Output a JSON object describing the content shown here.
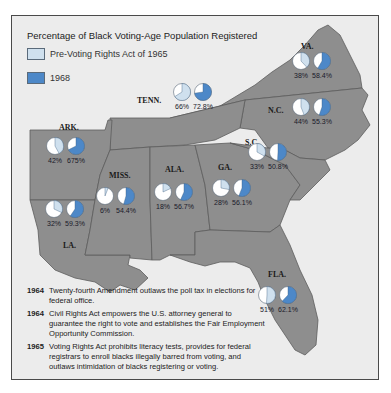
{
  "title": "Percentage of Black Voting-Age Population Registered",
  "legend": [
    {
      "label": "Pre-Voting Rights Act of 1965",
      "color": "#cfe0ee"
    },
    {
      "label": "1968",
      "color": "#4d88c8"
    }
  ],
  "colors": {
    "land": "#8e8e8e",
    "border": "#5d5d5d",
    "background": "#ececec",
    "pie_empty": "#ffffff"
  },
  "chart_data": {
    "type": "pie",
    "title": "Percentage of Black Voting-Age Population Registered",
    "series_names": [
      "Pre-Voting Rights Act of 1965",
      "1968"
    ],
    "states": [
      {
        "state": "VA.",
        "pre": 38,
        "post": 58.4,
        "pre_label": "38%",
        "post_label": "58.4%"
      },
      {
        "state": "N.C.",
        "pre": 44,
        "post": 55.3,
        "pre_label": "44%",
        "post_label": "55.3%"
      },
      {
        "state": "TENN.",
        "pre": 66,
        "post": 72.8,
        "pre_label": "66%",
        "post_label": "72.8%"
      },
      {
        "state": "ARK.",
        "pre": 42,
        "post": 67.5,
        "pre_label": "42%",
        "post_label": "675%"
      },
      {
        "state": "S.C.",
        "pre": 33,
        "post": 50.8,
        "pre_label": "33%",
        "post_label": "50.8%"
      },
      {
        "state": "MISS.",
        "pre": 6,
        "post": 54.4,
        "pre_label": "6%",
        "post_label": "54.4%"
      },
      {
        "state": "ALA.",
        "pre": 18,
        "post": 56.7,
        "pre_label": "18%",
        "post_label": "56.7%"
      },
      {
        "state": "GA.",
        "pre": 28,
        "post": 56.1,
        "pre_label": "28%",
        "post_label": "56.1%"
      },
      {
        "state": "LA.",
        "pre": 32,
        "post": 59.3,
        "pre_label": "32%",
        "post_label": "59.3%"
      },
      {
        "state": "FLA.",
        "pre": 51,
        "post": 62.1,
        "pre_label": "51%",
        "post_label": "62.1%"
      }
    ]
  },
  "events": [
    {
      "year": "1964",
      "text": "Twenty-fourth Amendment outlaws the poll tax in elections for federal office."
    },
    {
      "year": "1964",
      "text": "Civil Rights Act empowers the U.S. attorney general to guarantee the right to vote and establishes the Fair Employment Opportunity Commission."
    },
    {
      "year": "1965",
      "text": "Voting Rights Act prohibits literacy tests, provides for federal registrars to enroll blacks illegally barred from voting, and outlaws intimidation of blacks registering or voting."
    }
  ]
}
